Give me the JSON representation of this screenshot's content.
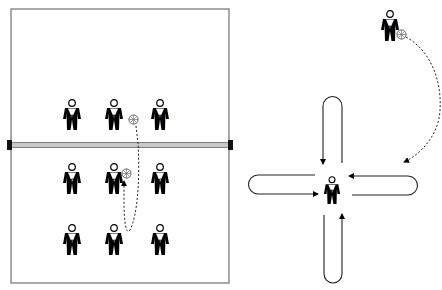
{
  "diagram": {
    "type": "volleyball-drill",
    "colors": {
      "line": "#000000",
      "court": "#555555",
      "net": "#bbbbbb",
      "post": "#111111",
      "background": "#ffffff"
    },
    "court": {
      "net_label": "",
      "players": [
        {
          "role": "T",
          "x": 72,
          "y": 100,
          "side": "far"
        },
        {
          "role": "T",
          "x": 113,
          "y": 100,
          "side": "far",
          "has_ball": true,
          "ball_x": 133,
          "ball_y": 121
        },
        {
          "role": "T",
          "x": 160,
          "y": 100,
          "side": "far"
        },
        {
          "role": "C",
          "x": 72,
          "y": 164,
          "side": "near"
        },
        {
          "role": "C",
          "x": 113,
          "y": 164,
          "side": "near",
          "has_ball": true,
          "ball_x": 126,
          "ball_y": 173
        },
        {
          "role": "C",
          "x": 160,
          "y": 164,
          "side": "near"
        },
        {
          "role": "P",
          "x": 72,
          "y": 225,
          "side": "near"
        },
        {
          "role": "P",
          "x": 113,
          "y": 225,
          "side": "near"
        },
        {
          "role": "P",
          "x": 160,
          "y": 225,
          "side": "near"
        }
      ],
      "ball_path": "dashed path from ball over net down to P then up to C"
    },
    "pattern": {
      "center_player": {
        "role": "P",
        "x": 332,
        "y": 174
      },
      "outer_player": {
        "role": "T",
        "x": 389,
        "y": 10,
        "ball_x": 401,
        "ball_y": 35
      },
      "loops": [
        "top",
        "left",
        "right",
        "bottom"
      ],
      "ball_path": "dashed arc from T player's ball to center"
    }
  }
}
